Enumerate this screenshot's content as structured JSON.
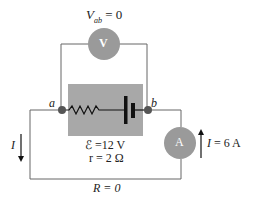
{
  "diagram": {
    "voltmeter": {
      "symbol": "V",
      "reading_label": "V",
      "reading_sub": "ab",
      "reading_value": "= 0"
    },
    "ammeter": {
      "symbol": "A",
      "current_label": "I",
      "current_value": "= 6 A"
    },
    "nodes": {
      "a": "a",
      "b": "b"
    },
    "battery": {
      "emf_label": "ℰ =12 V",
      "internal_resistance_label": "r = 2 Ω"
    },
    "left_current_label": "I",
    "external_resistance_label": "R = 0",
    "colors": {
      "meter_fill": "#9a9a9a",
      "box_fill": "#a8a8a8",
      "wire": "#555555",
      "node": "#555555"
    }
  }
}
